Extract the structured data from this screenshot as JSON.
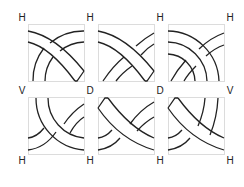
{
  "diagram": {
    "type": "celtic-knot-tiles",
    "grid": {
      "rows": 2,
      "cols": 3
    },
    "labels": [
      {
        "id": "top-0",
        "text": "H",
        "x": 22,
        "y": 18
      },
      {
        "id": "top-1",
        "text": "H",
        "x": 90,
        "y": 18
      },
      {
        "id": "top-2",
        "text": "H",
        "x": 160,
        "y": 18
      },
      {
        "id": "top-3",
        "text": "H",
        "x": 230,
        "y": 18
      },
      {
        "id": "mid-0",
        "text": "V",
        "x": 22,
        "y": 91
      },
      {
        "id": "mid-1",
        "text": "D",
        "x": 90,
        "y": 91
      },
      {
        "id": "mid-2",
        "text": "D",
        "x": 160,
        "y": 91
      },
      {
        "id": "mid-3",
        "text": "V",
        "x": 230,
        "y": 91
      },
      {
        "id": "bot-0",
        "text": "H",
        "x": 22,
        "y": 161
      },
      {
        "id": "bot-1",
        "text": "H",
        "x": 90,
        "y": 161
      },
      {
        "id": "bot-2",
        "text": "H",
        "x": 160,
        "y": 161
      },
      {
        "id": "bot-3",
        "text": "H",
        "x": 230,
        "y": 161
      }
    ],
    "colors": {
      "stroke": "#222222",
      "tile_border": "#d8d8d8",
      "background": "#ffffff"
    }
  }
}
